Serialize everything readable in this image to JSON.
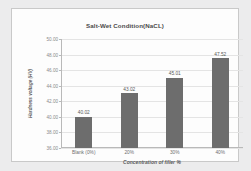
{
  "chart_data": {
    "type": "bar",
    "title": "Salt-Wet Condition(NaCL)",
    "xlabel": "Concentration of filler %",
    "ylabel": "Hardness voltage (HV)",
    "categories": [
      "Blank (0%)",
      "20%",
      "30%",
      "40%"
    ],
    "values": [
      40.02,
      43.02,
      45.01,
      47.52
    ],
    "data_labels": [
      "40.02",
      "43.02",
      "45.01",
      "47.52"
    ],
    "ylim": [
      36.0,
      50.0
    ],
    "yticks": [
      36.0,
      38.0,
      40.0,
      42.0,
      44.0,
      46.0,
      48.0,
      50.0
    ],
    "ytick_labels": [
      "36.00",
      "38.00",
      "40.00",
      "42.00",
      "44.00",
      "46.00",
      "48.00",
      "50.00"
    ],
    "grid": true,
    "legend": false,
    "series_color": "#6d6d6d",
    "plot_background": "#fdfdfd",
    "figure_background": "#ececed"
  }
}
